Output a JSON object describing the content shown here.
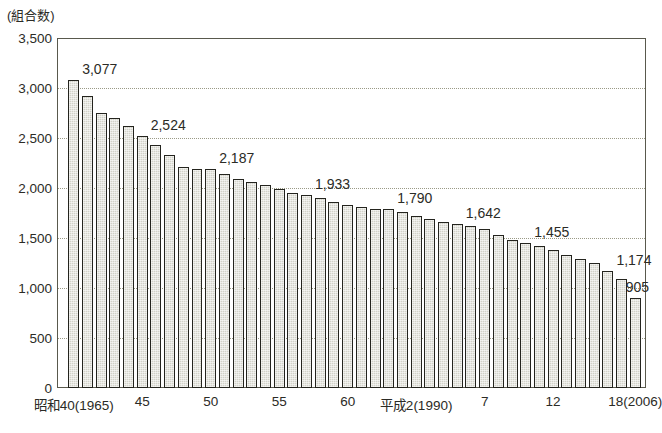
{
  "chart_data": {
    "type": "bar",
    "title": "",
    "unit_note": "(組合数)",
    "xlabel": "",
    "ylabel": "",
    "ylim": [
      0,
      3500
    ],
    "ytick_values": [
      0,
      500,
      1000,
      1500,
      2000,
      2500,
      3000,
      3500
    ],
    "ytick_labels": [
      "0",
      "500",
      "1,000",
      "1,500",
      "2,000",
      "2,500",
      "3,000",
      "3,500"
    ],
    "grid": true,
    "legend": "none",
    "bar_fill_color": "#d2d2c8",
    "bar_edge_color": "#24241e",
    "frame_color": "#59594d",
    "gridline_color": "#9a9a86",
    "x": [
      1965,
      1966,
      1967,
      1968,
      1969,
      1970,
      1971,
      1972,
      1973,
      1974,
      1975,
      1976,
      1977,
      1978,
      1979,
      1980,
      1981,
      1982,
      1983,
      1984,
      1985,
      1986,
      1987,
      1988,
      1989,
      1990,
      1991,
      1992,
      1993,
      1994,
      1995,
      1996,
      1997,
      1998,
      1999,
      2000,
      2001,
      2002,
      2003,
      2004,
      2005,
      2006
    ],
    "categories": [
      "1965",
      "1966",
      "1967",
      "1968",
      "1969",
      "1970",
      "1971",
      "1972",
      "1973",
      "1974",
      "1975",
      "1976",
      "1977",
      "1978",
      "1979",
      "1980",
      "1981",
      "1982",
      "1983",
      "1984",
      "1985",
      "1986",
      "1987",
      "1988",
      "1989",
      "1990",
      "1991",
      "1992",
      "1993",
      "1994",
      "1995",
      "1996",
      "1997",
      "1998",
      "1999",
      "2000",
      "2001",
      "2002",
      "2003",
      "2004",
      "2005",
      "2006"
    ],
    "values": [
      3077,
      2920,
      2755,
      2700,
      2625,
      2524,
      2430,
      2330,
      2215,
      2190,
      2187,
      2140,
      2090,
      2060,
      2035,
      1990,
      1955,
      1933,
      1900,
      1860,
      1830,
      1810,
      1795,
      1790,
      1760,
      1720,
      1690,
      1660,
      1642,
      1620,
      1590,
      1530,
      1480,
      1455,
      1420,
      1380,
      1330,
      1290,
      1250,
      1174,
      1090,
      905
    ],
    "xtick_labels": [
      {
        "label": "昭和40(1965)",
        "x_year": 1965
      },
      {
        "label": "45",
        "x_year": 1970
      },
      {
        "label": "50",
        "x_year": 1975
      },
      {
        "label": "55",
        "x_year": 1980
      },
      {
        "label": "60",
        "x_year": 1985
      },
      {
        "label": "平成2(1990)",
        "x_year": 1990
      },
      {
        "label": "7",
        "x_year": 1995
      },
      {
        "label": "12",
        "x_year": 2000
      },
      {
        "label": "18(2006)",
        "x_year": 2006
      }
    ],
    "data_labels": [
      {
        "text": "3,077",
        "x_year": 1965,
        "value": 3077
      },
      {
        "text": "2,524",
        "x_year": 1970,
        "value": 2524
      },
      {
        "text": "2,187",
        "x_year": 1975,
        "value": 2187
      },
      {
        "text": "1,933",
        "x_year": 1982,
        "value": 1933
      },
      {
        "text": "1,790",
        "x_year": 1988,
        "value": 1790
      },
      {
        "text": "1,642",
        "x_year": 1993,
        "value": 1642
      },
      {
        "text": "1,455",
        "x_year": 1998,
        "value": 1455
      },
      {
        "text": "1,174",
        "x_year": 2004,
        "value": 1174
      },
      {
        "text": "905",
        "x_year": 2006,
        "value": 905
      }
    ]
  }
}
